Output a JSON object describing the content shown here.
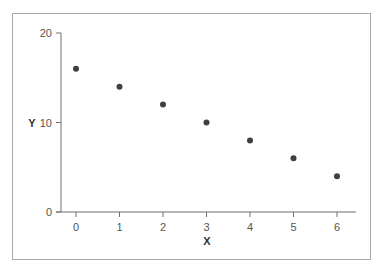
{
  "chart_data": {
    "type": "scatter",
    "title": "",
    "xlabel": "X",
    "ylabel": "Y",
    "x": [
      0,
      1,
      2,
      3,
      4,
      5,
      6
    ],
    "y": [
      16,
      14,
      12,
      10,
      8,
      6,
      4
    ],
    "xlim": [
      0,
      6
    ],
    "ylim": [
      0,
      20
    ],
    "xticks": [
      0,
      1,
      2,
      3,
      4,
      5,
      6
    ],
    "yticks": [
      0,
      10,
      20
    ],
    "grid": false,
    "legend": null,
    "marker_color": "#404040"
  },
  "labels": {
    "xticks": [
      "0",
      "1",
      "2",
      "3",
      "4",
      "5",
      "6"
    ],
    "yticks": [
      "0",
      "10",
      "20"
    ],
    "xlabel": "X",
    "ylabel": "Y"
  }
}
